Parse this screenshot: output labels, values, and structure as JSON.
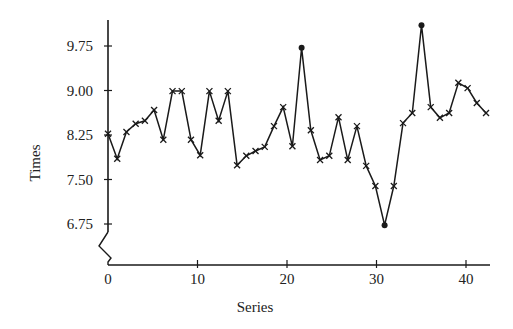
{
  "chart_data": {
    "type": "line",
    "title": "",
    "xlabel": "Series",
    "ylabel": "Times",
    "x": [
      0,
      1,
      2,
      3,
      4,
      5,
      6,
      7,
      8,
      9,
      10,
      11,
      12,
      13,
      14,
      15,
      16,
      17,
      18,
      19,
      20,
      21,
      22,
      23,
      24,
      25,
      26,
      27,
      28,
      29,
      30,
      31,
      32,
      33,
      34,
      35,
      36,
      37,
      38,
      39,
      40,
      41
    ],
    "values": [
      8.27,
      7.85,
      8.3,
      8.44,
      8.49,
      8.67,
      8.17,
      8.99,
      8.99,
      8.17,
      7.91,
      8.99,
      8.49,
      8.99,
      7.74,
      7.9,
      7.98,
      8.05,
      8.4,
      8.72,
      8.06,
      9.72,
      8.33,
      7.83,
      7.9,
      8.55,
      7.83,
      8.4,
      7.73,
      7.39,
      6.73,
      7.39,
      8.45,
      8.62,
      10.1,
      8.72,
      8.54,
      8.62,
      9.13,
      9.04,
      8.79,
      8.62
    ],
    "highlighted_points": [
      21,
      30,
      34
    ],
    "marker": "x",
    "highlight_marker": "dot",
    "xticks": [
      0,
      10,
      20,
      30,
      40
    ],
    "xtick_labels": [
      "0",
      "10",
      "20",
      "30",
      "40"
    ],
    "yticks": [
      6.75,
      7.5,
      8.25,
      9.0,
      9.75
    ],
    "ytick_labels": [
      "6.75",
      "7.50",
      "8.25",
      "9.00",
      "9.75"
    ],
    "xlim": [
      0,
      42
    ],
    "ylim": [
      6.2,
      10.15
    ],
    "y_axis_break": true,
    "grid": false,
    "legend": null
  }
}
